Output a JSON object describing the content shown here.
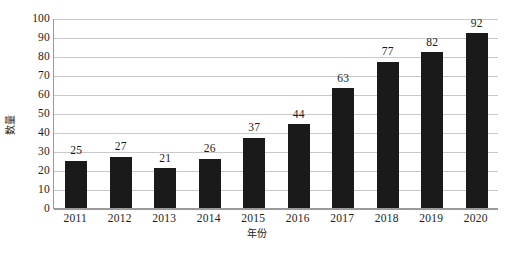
{
  "chart_data": {
    "type": "bar",
    "title": "",
    "subtitle": "",
    "xlabel": "年份",
    "ylabel": "数量",
    "categories": [
      "2011",
      "2012",
      "2013",
      "2014",
      "2015",
      "2016",
      "2017",
      "2018",
      "2019",
      "2020"
    ],
    "values": [
      25,
      27,
      21,
      26,
      37,
      44,
      63,
      77,
      82,
      92
    ],
    "data_labels": [
      "25",
      "27",
      "21",
      "26",
      "37",
      "44",
      "63",
      "77",
      "82",
      "92"
    ],
    "ylim": [
      0,
      100
    ],
    "ytick_values": [
      0,
      10,
      20,
      30,
      40,
      50,
      60,
      70,
      80,
      90,
      100
    ],
    "ytick_labels": [
      "0",
      "10",
      "20",
      "30",
      "40",
      "50",
      "60",
      "70",
      "80",
      "90",
      "100"
    ],
    "grid": "horizontal",
    "legend": "none",
    "series": [
      {
        "name": "数量",
        "values": [
          25,
          27,
          21,
          26,
          37,
          44,
          63,
          77,
          82,
          92
        ]
      }
    ],
    "colors": {
      "bar": "#1a1a1a",
      "gridline": "#c9c9c9",
      "axis": "#9a9a9a",
      "text": "#1c1c1c",
      "background": "#ffffff"
    }
  }
}
